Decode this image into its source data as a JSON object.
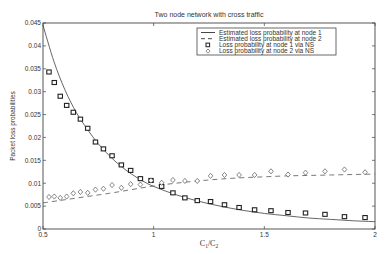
{
  "chart_data": {
    "type": "line",
    "title": "Two node network with cross traffic",
    "xlabel": "C1/C2",
    "ylabel": "Packet loss probabilities",
    "xlim": [
      0.5,
      2.0
    ],
    "ylim": [
      0,
      0.045
    ],
    "xticks": [
      0.5,
      1,
      1.5,
      2
    ],
    "xtick_labels": [
      "0.5",
      "1",
      "1.5",
      "2"
    ],
    "yticks": [
      0,
      0.005,
      0.01,
      0.015,
      0.02,
      0.025,
      0.03,
      0.035,
      0.04,
      0.045
    ],
    "ytick_labels": [
      "0",
      "0.005",
      "0.01",
      "0.015",
      "0.02",
      "0.025",
      "0.03",
      "0.035",
      "0.04",
      "0.045"
    ],
    "grid": false,
    "legend_position": "upper right",
    "series": [
      {
        "name": "Estimated loss probability at node 1",
        "style": "solid-line",
        "x": [
          0.5,
          0.55,
          0.6,
          0.65,
          0.7,
          0.75,
          0.8,
          0.85,
          0.9,
          0.95,
          1.0,
          1.1,
          1.2,
          1.3,
          1.4,
          1.5,
          1.6,
          1.7,
          1.8,
          1.9,
          2.0
        ],
        "values": [
          0.0445,
          0.0365,
          0.0303,
          0.0255,
          0.0218,
          0.0186,
          0.016,
          0.0138,
          0.012,
          0.0105,
          0.0093,
          0.0075,
          0.0061,
          0.005,
          0.0041,
          0.0034,
          0.0029,
          0.0024,
          0.0021,
          0.0018,
          0.0016
        ]
      },
      {
        "name": "Estimated loss probability at node 2",
        "style": "dashed-line",
        "x": [
          0.5,
          0.6,
          0.7,
          0.8,
          0.9,
          1.0,
          1.1,
          1.2,
          1.3,
          1.4,
          1.5,
          1.6,
          1.7,
          1.8,
          1.9,
          2.0
        ],
        "values": [
          0.0057,
          0.0064,
          0.0071,
          0.0078,
          0.0086,
          0.0094,
          0.01,
          0.0105,
          0.0109,
          0.0112,
          0.0114,
          0.0116,
          0.0117,
          0.0118,
          0.0119,
          0.012
        ]
      },
      {
        "name": "Loss probability at node 1 via NS",
        "style": "square-marker",
        "x": [
          0.527,
          0.551,
          0.578,
          0.607,
          0.637,
          0.669,
          0.702,
          0.737,
          0.773,
          0.812,
          0.854,
          0.896,
          0.94,
          0.988,
          1.036,
          1.087,
          1.141,
          1.197,
          1.257,
          1.32,
          1.386,
          1.456,
          1.53,
          1.607,
          1.686,
          1.774,
          1.862,
          1.955
        ],
        "values": [
          0.0343,
          0.032,
          0.029,
          0.027,
          0.0255,
          0.024,
          0.022,
          0.019,
          0.0175,
          0.016,
          0.014,
          0.0128,
          0.011,
          0.0106,
          0.0093,
          0.0079,
          0.0068,
          0.0062,
          0.006,
          0.0053,
          0.0047,
          0.0042,
          0.004,
          0.0036,
          0.0035,
          0.0032,
          0.0027,
          0.0025
        ]
      },
      {
        "name": "Loss probability at node 2 via NS",
        "style": "diamond-marker",
        "x": [
          0.527,
          0.551,
          0.578,
          0.607,
          0.637,
          0.669,
          0.702,
          0.737,
          0.773,
          0.812,
          0.854,
          0.896,
          0.94,
          0.988,
          1.036,
          1.087,
          1.141,
          1.197,
          1.257,
          1.32,
          1.386,
          1.456,
          1.53,
          1.607,
          1.686,
          1.774,
          1.862,
          1.955
        ],
        "values": [
          0.007,
          0.0071,
          0.0068,
          0.0071,
          0.0078,
          0.0081,
          0.0079,
          0.0086,
          0.0088,
          0.0096,
          0.009,
          0.0098,
          0.0097,
          0.0106,
          0.0101,
          0.0107,
          0.0105,
          0.0105,
          0.0116,
          0.0118,
          0.0118,
          0.0118,
          0.0126,
          0.0119,
          0.0123,
          0.0126,
          0.013,
          0.0124
        ]
      }
    ]
  },
  "layout": {
    "plot_left": 43,
    "plot_right": 375,
    "plot_top": 23,
    "plot_bottom": 229,
    "line_color": "#555555",
    "marker_color": "#222222"
  }
}
